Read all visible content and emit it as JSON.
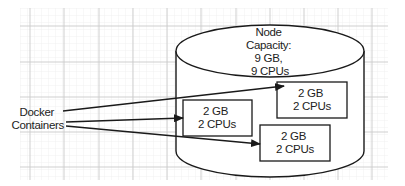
{
  "diagram": {
    "type": "node-capacity-diagram",
    "node": {
      "label_lines": [
        "Node",
        "Capacity:",
        "9 GB,",
        "9 CPUs"
      ],
      "memory": "9 GB",
      "cpus": "9 CPUs"
    },
    "source_label": {
      "lines": [
        "Docker",
        "Containers"
      ]
    },
    "containers": [
      {
        "id": "container-1",
        "lines": [
          "2 GB",
          "2 CPUs"
        ],
        "memory": "2 GB",
        "cpus": "2 CPUs"
      },
      {
        "id": "container-2",
        "lines": [
          "2 GB",
          "2 CPUs"
        ],
        "memory": "2 GB",
        "cpus": "2 CPUs"
      },
      {
        "id": "container-3",
        "lines": [
          "2 GB",
          "2 CPUs"
        ],
        "memory": "2 GB",
        "cpus": "2 CPUs"
      }
    ],
    "edges": [
      {
        "from": "Docker Containers",
        "to": "container-2"
      },
      {
        "from": "Docker Containers",
        "to": "container-1"
      },
      {
        "from": "Docker Containers",
        "to": "container-3"
      }
    ],
    "colors": {
      "stroke": "#1a1a1a",
      "text": "#222222",
      "grid_major": "#c9c9c9",
      "grid_minor": "#ededed",
      "background": "#ffffff"
    }
  }
}
